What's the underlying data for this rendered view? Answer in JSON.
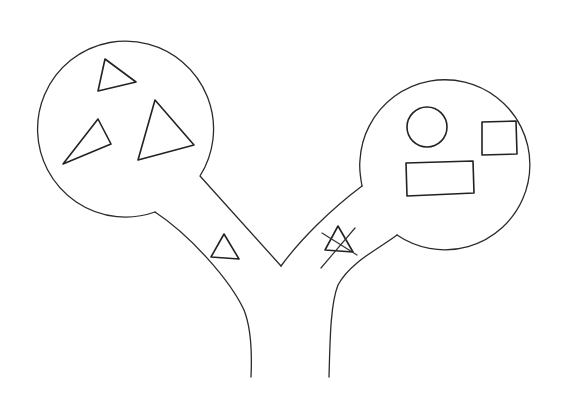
{
  "diagram": {
    "colors": {
      "stroke": "#2b2b2b",
      "background": "#ffffff"
    },
    "left_chamber": {
      "contents": [
        "triangle",
        "triangle",
        "triangle"
      ]
    },
    "right_chamber": {
      "contents": [
        "circle",
        "square",
        "rectangle"
      ]
    },
    "left_branch": {
      "item": "triangle"
    },
    "right_branch": {
      "item": "triangle-crossed-out"
    }
  }
}
